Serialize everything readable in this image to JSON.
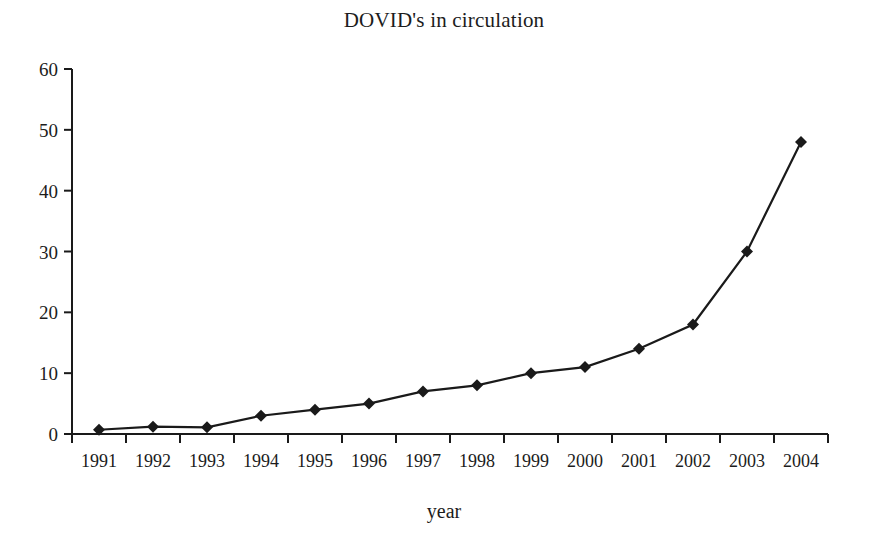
{
  "chart_data": {
    "type": "line",
    "title": "DOVID's in circulation",
    "xlabel": "year",
    "ylabel": "",
    "categories": [
      "1991",
      "1992",
      "1993",
      "1994",
      "1995",
      "1996",
      "1997",
      "1998",
      "1999",
      "2000",
      "2001",
      "2002",
      "2003",
      "2004"
    ],
    "values": [
      0.7,
      1.2,
      1.1,
      3,
      4,
      5,
      7,
      8,
      10,
      11,
      14,
      18,
      30,
      48
    ],
    "series": [
      {
        "name": "DOVID's in circulation",
        "values": [
          0.7,
          1.2,
          1.1,
          3,
          4,
          5,
          7,
          8,
          10,
          11,
          14,
          18,
          30,
          48
        ]
      }
    ],
    "ylim": [
      0,
      60
    ],
    "yticks": [
      0,
      10,
      20,
      30,
      40,
      50,
      60
    ],
    "ytick_labels": [
      "0",
      "10",
      "20",
      "30",
      "40",
      "50",
      "60"
    ],
    "xtick_labels": [
      "1991",
      "1992",
      "1993",
      "1994",
      "1995",
      "1996",
      "1997",
      "1998",
      "1999",
      "2000",
      "2001",
      "2002",
      "2003",
      "2004"
    ],
    "grid": false,
    "legend": false,
    "legend_position": "none",
    "marker": "diamond",
    "line_color": "#1a1a1a",
    "marker_color": "#1a1a1a",
    "background_color": "#ffffff",
    "axis_color": "#1a1a1a"
  },
  "figure": {
    "title": "DOVID's in circulation",
    "xaxis_title": "year"
  }
}
